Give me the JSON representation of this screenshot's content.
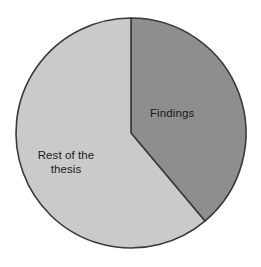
{
  "chart_data": {
    "type": "pie",
    "title": "",
    "subtitle": "",
    "xlabel": "",
    "ylabel": "",
    "grid": false,
    "legend_position": "none",
    "labels_inside": true,
    "start_angle_deg": 0,
    "direction": "clockwise",
    "categories": [
      "Findings",
      "Rest of the thesis"
    ],
    "values": [
      39,
      61
    ],
    "value_unit": "percent",
    "slices": [
      {
        "label": "Findings",
        "value": 39,
        "angle_deg": 140,
        "color": "#8e8e8e",
        "edge_color": "#3a3a3a"
      },
      {
        "label": "Rest of the\nthesis",
        "value": 61,
        "angle_deg": 220,
        "color": "#cacaca",
        "edge_color": "#3a3a3a"
      }
    ],
    "annotations": []
  },
  "figure": {
    "background": "#ffffff",
    "outline_color": "#3a3a3a",
    "text_color": "#1a1a1a",
    "center_x": 131,
    "center_y": 133,
    "radius": 115
  },
  "labels": {
    "findings": "Findings",
    "rest_of_thesis": "Rest of the\nthesis"
  }
}
